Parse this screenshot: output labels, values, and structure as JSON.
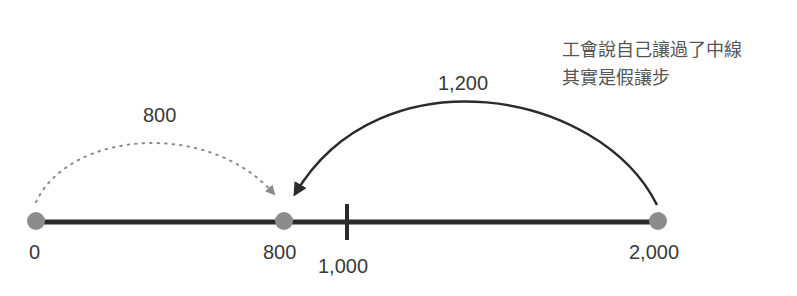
{
  "annotation": {
    "line1": "工會說自己讓過了中線",
    "line2": "其實是假讓步"
  },
  "number_line": {
    "points": [
      {
        "label": "0",
        "value": 0
      },
      {
        "label": "800",
        "value": 800
      },
      {
        "label": "2,000",
        "value": 2000
      }
    ],
    "midpoint": {
      "label": "1,000",
      "value": 1000
    }
  },
  "arcs": {
    "dotted": {
      "label": "800",
      "from": 0,
      "to": 800,
      "style": "dotted"
    },
    "solid": {
      "label": "1,200",
      "from": 2000,
      "to": 800,
      "style": "solid"
    }
  },
  "colors": {
    "line": "#2b2b2b",
    "dot": "#8c8c8c",
    "dotted_arc": "#8a8a8a",
    "solid_arc": "#2b2b2b"
  }
}
